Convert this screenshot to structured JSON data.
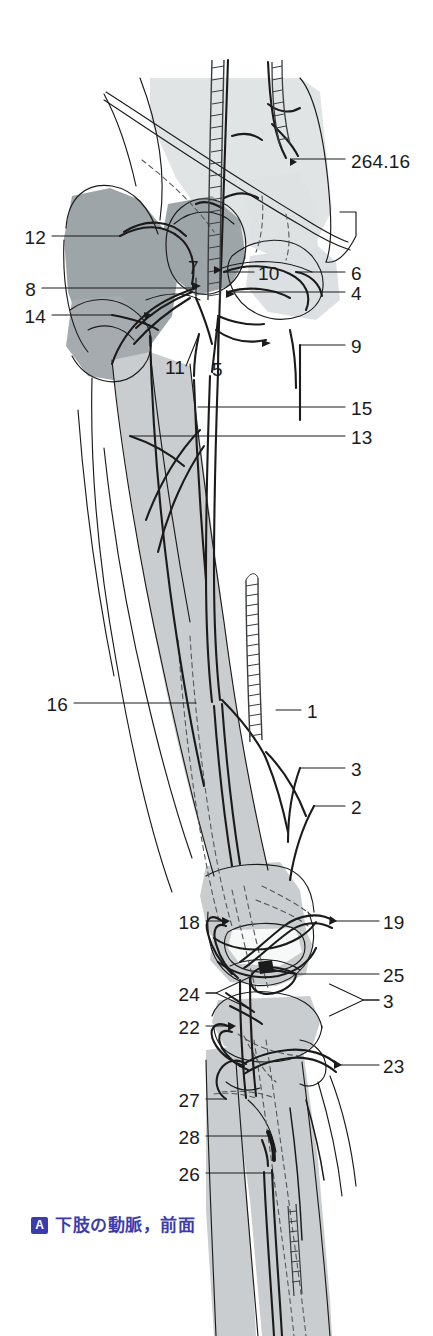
{
  "figure": {
    "domain": "anatomy-atlas-plate",
    "caption_badge": "A",
    "caption_text": "下肢の動脈，前面",
    "caption_color": "#3b3bad",
    "cross_reference": "264.16",
    "palette": {
      "background": "#ffffff",
      "ink": "#1b1b1b",
      "bone_light": "#c9cdcf",
      "bone_mid": "#9ea5a8",
      "bone_pale": "#e1e4e5",
      "vessel_stroke": "#1b1b1b",
      "hidden_vessel_dash": "#55585a",
      "label_text": "#1b1b1b"
    },
    "leaders": [
      {
        "id": "264.16",
        "side": "right",
        "text_x": 351,
        "text_y": 152,
        "line_from_x": 345,
        "line_from_y": 159,
        "line_to_x": 292,
        "line_to_y": 159,
        "kind": "straight"
      },
      {
        "id": "12",
        "side": "left",
        "text_x": 26,
        "text_y": 228,
        "line_from_x": 52,
        "line_from_y": 236,
        "line_to_x": 120,
        "line_to_y": 236,
        "kind": "straight"
      },
      {
        "id": "8",
        "side": "left",
        "text_x": 26,
        "text_y": 280,
        "line_from_x": 42,
        "line_from_y": 288,
        "line_to_x": 196,
        "line_to_y": 288,
        "kind": "straight"
      },
      {
        "id": "14",
        "side": "left",
        "text_x": 26,
        "text_y": 307,
        "line_from_x": 52,
        "line_from_y": 315,
        "line_to_x": 112,
        "line_to_y": 315,
        "kind": "elbow"
      },
      {
        "id": "7",
        "side": "mid",
        "text_x": 188,
        "text_y": 258,
        "line_from_x": 196,
        "line_from_y": 278,
        "line_to_x": 196,
        "line_to_y": 298,
        "kind": "vertical"
      },
      {
        "id": "10",
        "side": "mid",
        "text_x": 258,
        "text_y": 264,
        "line_from_x": 254,
        "line_from_y": 272,
        "line_to_x": 224,
        "line_to_y": 272,
        "kind": "straight"
      },
      {
        "id": "6",
        "side": "right",
        "text_x": 351,
        "text_y": 264,
        "line_from_x": 345,
        "line_from_y": 272,
        "line_to_x": 296,
        "line_to_y": 272,
        "kind": "straight"
      },
      {
        "id": "4",
        "side": "right",
        "text_x": 351,
        "text_y": 284,
        "line_from_x": 345,
        "line_from_y": 292,
        "line_to_x": 228,
        "line_to_y": 292,
        "kind": "straight"
      },
      {
        "id": "9",
        "side": "right",
        "text_x": 351,
        "text_y": 337,
        "line_from_x": 345,
        "line_from_y": 345,
        "line_to_x": 300,
        "line_to_y": 345,
        "kind": "straight"
      },
      {
        "id": "11",
        "side": "mid",
        "text_x": 165,
        "text_y": 358,
        "line_from_x": 186,
        "line_from_y": 366,
        "line_to_x": 199,
        "line_to_y": 334,
        "kind": "elbow"
      },
      {
        "id": "5",
        "side": "mid",
        "text_x": 212,
        "text_y": 360,
        "line_from_x": 218,
        "line_from_y": 356,
        "line_to_x": 218,
        "line_to_y": 318,
        "kind": "vertical"
      },
      {
        "id": "15",
        "side": "right",
        "text_x": 351,
        "text_y": 399,
        "line_from_x": 345,
        "line_from_y": 407,
        "line_to_x": 198,
        "line_to_y": 407,
        "kind": "straight"
      },
      {
        "id": "13",
        "side": "right",
        "text_x": 351,
        "text_y": 428,
        "line_from_x": 345,
        "line_from_y": 436,
        "line_to_x": 130,
        "line_to_y": 436,
        "kind": "straight"
      },
      {
        "id": "16",
        "side": "left",
        "text_x": 48,
        "text_y": 695,
        "line_from_x": 74,
        "line_from_y": 703,
        "line_to_x": 196,
        "line_to_y": 703,
        "kind": "straight"
      },
      {
        "id": "1",
        "side": "right",
        "text_x": 307,
        "text_y": 702,
        "line_from_x": 301,
        "line_from_y": 710,
        "line_to_x": 276,
        "line_to_y": 710,
        "kind": "straight"
      },
      {
        "id": "3",
        "side": "right",
        "text_x": 351,
        "text_y": 760,
        "line_from_x": 345,
        "line_from_y": 768,
        "line_to_x": 300,
        "line_to_y": 768,
        "kind": "straight"
      },
      {
        "id": "2",
        "side": "right",
        "text_x": 351,
        "text_y": 798,
        "line_from_x": 345,
        "line_from_y": 806,
        "line_to_x": 314,
        "line_to_y": 806,
        "kind": "straight"
      },
      {
        "id": "18",
        "side": "left",
        "text_x": 180,
        "text_y": 913,
        "line_from_x": 206,
        "line_from_y": 921,
        "line_to_x": 222,
        "line_to_y": 921,
        "kind": "straight"
      },
      {
        "id": "19",
        "side": "right",
        "text_x": 383,
        "text_y": 913,
        "line_from_x": 379,
        "line_from_y": 921,
        "line_to_x": 334,
        "line_to_y": 921,
        "kind": "straight"
      },
      {
        "id": "25",
        "side": "right",
        "text_x": 383,
        "text_y": 966,
        "line_from_x": 379,
        "line_from_y": 974,
        "line_to_x": 296,
        "line_to_y": 974,
        "kind": "straight"
      },
      {
        "id": "24",
        "side": "left",
        "text_x": 180,
        "text_y": 985,
        "line_from_x": 206,
        "line_from_y": 993,
        "line_to_x": 226,
        "line_to_y": 993,
        "kind": "fork"
      },
      {
        "id": "3b",
        "label": "3",
        "side": "right",
        "text_x": 383,
        "text_y": 992,
        "line_from_x": 379,
        "line_from_y": 1000,
        "line_to_x": 348,
        "line_to_y": 1000,
        "kind": "fork"
      },
      {
        "id": "22",
        "side": "left",
        "text_x": 180,
        "text_y": 1018,
        "line_from_x": 206,
        "line_from_y": 1026,
        "line_to_x": 228,
        "line_to_y": 1026,
        "kind": "straight"
      },
      {
        "id": "23",
        "side": "right",
        "text_x": 383,
        "text_y": 1057,
        "line_from_x": 379,
        "line_from_y": 1065,
        "line_to_x": 338,
        "line_to_y": 1065,
        "kind": "straight"
      },
      {
        "id": "27",
        "side": "left",
        "text_x": 180,
        "text_y": 1091,
        "line_from_x": 206,
        "line_from_y": 1099,
        "line_to_x": 226,
        "line_to_y": 1099,
        "kind": "straight"
      },
      {
        "id": "28",
        "side": "left",
        "text_x": 180,
        "text_y": 1128,
        "line_from_x": 206,
        "line_from_y": 1136,
        "line_to_x": 270,
        "line_to_y": 1136,
        "kind": "straight"
      },
      {
        "id": "26",
        "side": "left",
        "text_x": 180,
        "text_y": 1165,
        "line_from_x": 206,
        "line_from_y": 1173,
        "line_to_x": 272,
        "line_to_y": 1173,
        "kind": "straight"
      }
    ]
  }
}
